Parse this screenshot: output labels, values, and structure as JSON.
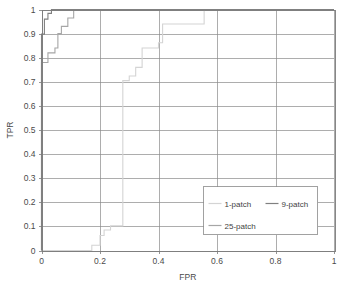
{
  "chart_data": {
    "type": "line",
    "title": "",
    "xlabel": "FPR",
    "ylabel": "TPR",
    "xlim": [
      0,
      1
    ],
    "ylim": [
      0,
      1
    ],
    "xticks": [
      "0",
      "0.2",
      "0.4",
      "0.6",
      "0.8",
      "1"
    ],
    "xtick_values": [
      0,
      0.2,
      0.4,
      0.6,
      0.8,
      1
    ],
    "yticks": [
      "0",
      "0.1",
      "0.2",
      "0.3",
      "0.4",
      "0.5",
      "0.6",
      "0.7",
      "0.8",
      "0.9",
      "1"
    ],
    "ytick_values": [
      0,
      0.1,
      0.2,
      0.3,
      0.4,
      0.5,
      0.6,
      0.7,
      0.8,
      0.9,
      1
    ],
    "grid": "horizontal-and-vertical",
    "legend_position": "inside-lower-right",
    "series": [
      {
        "name": "1-patch",
        "color": "#d4d4d4",
        "points": [
          [
            0.0,
            0.0
          ],
          [
            0.172,
            0.0
          ],
          [
            0.172,
            0.022
          ],
          [
            0.2,
            0.022
          ],
          [
            0.2,
            0.062
          ],
          [
            0.214,
            0.062
          ],
          [
            0.214,
            0.085
          ],
          [
            0.236,
            0.085
          ],
          [
            0.236,
            0.102
          ],
          [
            0.278,
            0.102
          ],
          [
            0.278,
            0.705
          ],
          [
            0.3,
            0.705
          ],
          [
            0.3,
            0.724
          ],
          [
            0.322,
            0.724
          ],
          [
            0.322,
            0.76
          ],
          [
            0.344,
            0.76
          ],
          [
            0.344,
            0.84
          ],
          [
            0.4,
            0.84
          ],
          [
            0.4,
            0.862
          ],
          [
            0.414,
            0.862
          ],
          [
            0.414,
            0.94
          ],
          [
            0.556,
            0.94
          ],
          [
            0.556,
            1.0
          ],
          [
            1.0,
            1.0
          ]
        ]
      },
      {
        "name": "9-patch",
        "color": "#808080",
        "points": [
          [
            0.0,
            0.0
          ],
          [
            0.0,
            0.898
          ],
          [
            0.01,
            0.898
          ],
          [
            0.01,
            0.96
          ],
          [
            0.022,
            0.96
          ],
          [
            0.022,
            0.984
          ],
          [
            0.034,
            0.984
          ],
          [
            0.034,
            1.0
          ],
          [
            1.0,
            1.0
          ]
        ]
      },
      {
        "name": "25-patch",
        "color": "#a6a6a6",
        "points": [
          [
            0.0,
            0.0
          ],
          [
            0.0,
            0.78
          ],
          [
            0.022,
            0.78
          ],
          [
            0.022,
            0.82
          ],
          [
            0.046,
            0.82
          ],
          [
            0.046,
            0.84
          ],
          [
            0.056,
            0.84
          ],
          [
            0.056,
            0.9
          ],
          [
            0.068,
            0.9
          ],
          [
            0.068,
            0.93
          ],
          [
            0.09,
            0.93
          ],
          [
            0.09,
            0.965
          ],
          [
            0.11,
            0.965
          ],
          [
            0.11,
            1.0
          ],
          [
            1.0,
            1.0
          ]
        ]
      }
    ]
  },
  "legend": {
    "entries": [
      {
        "label": "1-patch"
      },
      {
        "label": "9-patch"
      },
      {
        "label": "25-patch"
      }
    ]
  },
  "axes": {
    "x_title": "FPR",
    "y_title": "TPR"
  }
}
